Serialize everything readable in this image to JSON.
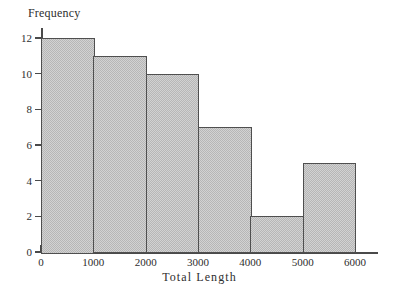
{
  "chart_data": {
    "type": "bar",
    "title": "",
    "subtitle": "",
    "xlabel": "Total Length",
    "ylabel": "Frequency",
    "categories": [
      "0-1000",
      "1000-2000",
      "2000-3000",
      "3000-4000",
      "4000-5000",
      "5000-6000"
    ],
    "bin_edges": [
      0,
      1000,
      2000,
      3000,
      4000,
      5000,
      6000
    ],
    "values": [
      12,
      11,
      10,
      7,
      2,
      5
    ],
    "xlim": [
      0,
      6000
    ],
    "ylim": [
      0,
      12
    ],
    "x_ticks": [
      "0",
      "1000",
      "2000",
      "3000",
      "4000",
      "5000",
      "6000"
    ],
    "x_tick_values": [
      0,
      1000,
      2000,
      3000,
      4000,
      5000,
      6000
    ],
    "y_ticks": [
      "0",
      "2",
      "4",
      "6",
      "8",
      "10",
      "12"
    ],
    "y_tick_values": [
      0,
      2,
      4,
      6,
      8,
      10,
      12
    ],
    "grid": false,
    "legend": false,
    "legend_position": "none",
    "annotations": [],
    "colors": {
      "background": "#ffffff",
      "bar_fill": "#d2d2d2",
      "bar_hatch": "#b6b6b6",
      "bar_border": "#4f4f4f",
      "axis": "#4a4a4a",
      "text": "#2e2e2e"
    }
  },
  "axes": {
    "y_title": "Frequency",
    "x_title": "Total Length"
  }
}
